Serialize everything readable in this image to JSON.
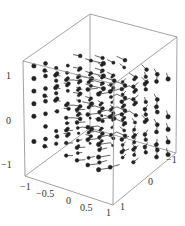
{
  "chart_data": {
    "type": "vector_field_3d",
    "title": "",
    "x_axis": {
      "label": "",
      "range": [
        -1,
        1
      ],
      "ticks": [
        "-1",
        "-0.5",
        "0",
        "0.5",
        "1"
      ]
    },
    "y_axis": {
      "label": "",
      "range": [
        -1,
        1
      ],
      "ticks": [
        "-1",
        "0",
        "1"
      ]
    },
    "z_axis": {
      "label": "",
      "range": [
        -1.3,
        1.3
      ],
      "ticks": [
        "-1",
        "0",
        "1"
      ]
    },
    "grid": false,
    "box": true,
    "field": "rotation about z: (-y, x, 0) style swirl",
    "grid_samples": 7,
    "colors": {
      "box_edge": "#8c8c8c",
      "arrow": "#222222",
      "text": "#333333"
    }
  },
  "projection": {
    "origin": [
      101,
      108
    ],
    "ex": [
      44,
      14.5
    ],
    "ey": [
      -33,
      11.5
    ],
    "ez": [
      0,
      -36
    ]
  },
  "labels": {
    "z_ticks": [
      {
        "text": "1",
        "x": 6,
        "y": 79
      },
      {
        "text": "0",
        "x": 6,
        "y": 124
      },
      {
        "text": "−1",
        "x": 1,
        "y": 168
      }
    ],
    "x_ticks": [
      {
        "text": "−1",
        "x": 20,
        "y": 190
      },
      {
        "text": "−0.5",
        "x": 36,
        "y": 197
      },
      {
        "text": "0",
        "x": 66,
        "y": 204
      },
      {
        "text": "0.5",
        "x": 80,
        "y": 211
      },
      {
        "text": "1",
        "x": 106,
        "y": 216
      }
    ],
    "y_ticks": [
      {
        "text": "1",
        "x": 120,
        "y": 210
      },
      {
        "text": "0",
        "x": 148,
        "y": 185
      },
      {
        "text": "−1",
        "x": 166,
        "y": 163
      }
    ]
  }
}
